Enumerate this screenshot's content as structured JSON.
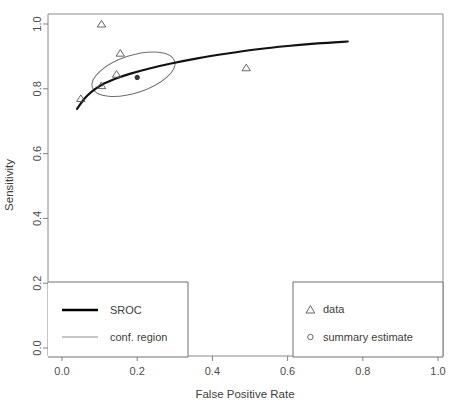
{
  "chart_data": {
    "type": "scatter",
    "title": "",
    "xlabel": "False Positive Rate",
    "ylabel": "Sensitivity",
    "xlim": [
      0.0,
      1.0
    ],
    "ylim": [
      0.0,
      1.0
    ],
    "xticks": [
      "0.0",
      "0.2",
      "0.4",
      "0.6",
      "0.8",
      "1.0"
    ],
    "xtick_values": [
      0.0,
      0.2,
      0.4,
      0.6,
      0.8,
      1.0
    ],
    "yticks": [
      "0.0",
      "0.2",
      "0.4",
      "0.6",
      "0.8",
      "1.0"
    ],
    "ytick_values": [
      0.0,
      0.2,
      0.4,
      0.6,
      0.8,
      1.0
    ],
    "grid": false,
    "series": [
      {
        "name": "data",
        "marker": "triangle",
        "points": [
          {
            "x": 0.05,
            "y": 0.77
          },
          {
            "x": 0.105,
            "y": 1.0
          },
          {
            "x": 0.105,
            "y": 0.81
          },
          {
            "x": 0.145,
            "y": 0.845
          },
          {
            "x": 0.155,
            "y": 0.91
          },
          {
            "x": 0.49,
            "y": 0.865
          }
        ]
      },
      {
        "name": "summary estimate",
        "marker": "circle",
        "points": [
          {
            "x": 0.2,
            "y": 0.835
          }
        ]
      },
      {
        "name": "SROC",
        "marker": "line",
        "points": [
          {
            "x": 0.04,
            "y": 0.738
          },
          {
            "x": 0.06,
            "y": 0.77
          },
          {
            "x": 0.08,
            "y": 0.792
          },
          {
            "x": 0.105,
            "y": 0.812
          },
          {
            "x": 0.14,
            "y": 0.83
          },
          {
            "x": 0.18,
            "y": 0.846
          },
          {
            "x": 0.23,
            "y": 0.862
          },
          {
            "x": 0.29,
            "y": 0.878
          },
          {
            "x": 0.36,
            "y": 0.894
          },
          {
            "x": 0.44,
            "y": 0.909
          },
          {
            "x": 0.52,
            "y": 0.922
          },
          {
            "x": 0.6,
            "y": 0.932
          },
          {
            "x": 0.68,
            "y": 0.94
          },
          {
            "x": 0.76,
            "y": 0.946
          }
        ]
      },
      {
        "name": "conf. region",
        "marker": "ellipse",
        "center": {
          "x": 0.19,
          "y": 0.845
        },
        "rx": 0.115,
        "ry": 0.058,
        "rotation_deg": -18
      }
    ]
  },
  "legend_left": {
    "items": [
      {
        "label": "SROC",
        "glyph": "thick-line",
        "color": "#000000"
      },
      {
        "label": "conf. region",
        "glyph": "thin-line",
        "color": "#808080"
      }
    ]
  },
  "legend_right": {
    "items": [
      {
        "label": "data",
        "glyph": "triangle-icon",
        "color": "#555555"
      },
      {
        "label": "summary estimate",
        "glyph": "circle-icon",
        "color": "#555555"
      }
    ]
  },
  "colors": {
    "frame": "#808080",
    "axis_text": "#4d4d4d",
    "sroc_curve": "#111111",
    "conf_region": "#6e6e6e",
    "marker": "#555555"
  }
}
